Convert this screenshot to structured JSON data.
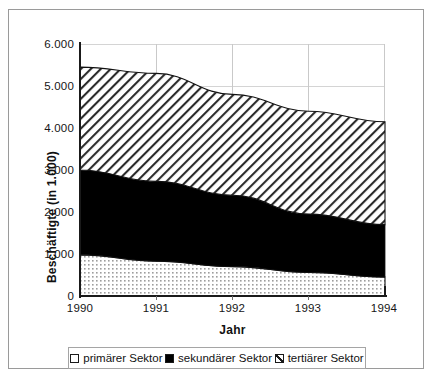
{
  "chart_data": {
    "type": "area",
    "title": "",
    "xlabel": "Jahr",
    "ylabel": "Beschäftigte (in 1.000)",
    "categories": [
      "1990",
      "1991",
      "1992",
      "1993",
      "1994"
    ],
    "x": [
      1990,
      1991,
      1992,
      1993,
      1994
    ],
    "stacked": true,
    "xlim": [
      1990,
      1994
    ],
    "ylim": [
      0,
      6000
    ],
    "yticks": [
      "0",
      "1.000",
      "2.000",
      "3.000",
      "4.000",
      "5.000",
      "6.000"
    ],
    "ytick_values": [
      0,
      1000,
      2000,
      3000,
      4000,
      5000,
      6000
    ],
    "xticks": [
      "1990",
      "1991",
      "1992",
      "1993",
      "1994"
    ],
    "grid": "both",
    "legend_position": "bottom",
    "series": [
      {
        "name": "primärer Sektor",
        "fill": "dotted",
        "color": "#ffffff",
        "values": [
          980,
          830,
          700,
          560,
          450
        ]
      },
      {
        "name": "sekundärer Sektor",
        "fill": "solid",
        "color": "#000000",
        "values": [
          2020,
          1900,
          1700,
          1390,
          1250
        ]
      },
      {
        "name": "tertiärer Sektor",
        "fill": "diagonal-hatch",
        "color": "#ffffff",
        "values": [
          2450,
          2570,
          2400,
          2450,
          2450
        ]
      }
    ],
    "cumulative": {
      "primary_top": [
        980,
        830,
        700,
        560,
        450
      ],
      "secondary_top": [
        3000,
        2730,
        2400,
        1950,
        1700
      ],
      "total_top": [
        5450,
        5300,
        4800,
        4400,
        4150
      ]
    }
  },
  "axes": {
    "ylabel": "Beschäftigte (in 1.000)",
    "xlabel": "Jahr",
    "ytick_labels": [
      "6.000",
      "5.000",
      "4.000",
      "3.000",
      "2.000",
      "1.000",
      "0"
    ],
    "xtick_labels": [
      "1990",
      "1991",
      "1992",
      "1993",
      "1994"
    ]
  },
  "legend": {
    "items": [
      {
        "label": "primärer Sektor",
        "swatch": "empty-square-icon"
      },
      {
        "label": "sekundärer Sektor",
        "swatch": "filled-square-icon"
      },
      {
        "label": "tertiärer Sektor",
        "swatch": "hatched-square-icon"
      }
    ]
  },
  "colors": {
    "axis": "#1a1a1a",
    "grid": "#c9c9c9",
    "secondary_fill": "#000000",
    "frame": "#9a9a9a"
  }
}
